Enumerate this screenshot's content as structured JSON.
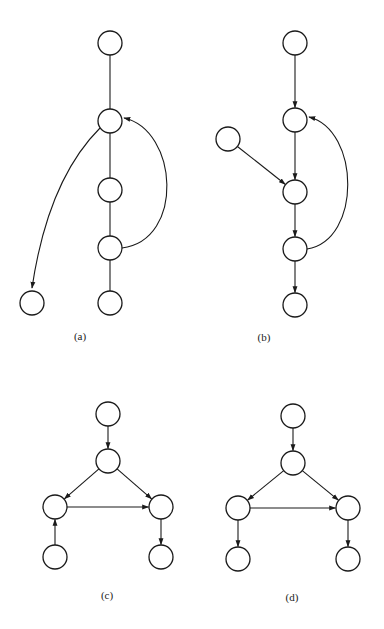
{
  "figure": {
    "panels": [
      {
        "id": "a",
        "caption": "(a)",
        "caption_pos": [
          80,
          330
        ],
        "nodes": [
          {
            "id": "a1",
            "x": 110,
            "y": 43
          },
          {
            "id": "a2",
            "x": 110,
            "y": 121
          },
          {
            "id": "a3",
            "x": 110,
            "y": 190
          },
          {
            "id": "a4",
            "x": 110,
            "y": 248
          },
          {
            "id": "a5",
            "x": 110,
            "y": 303
          },
          {
            "id": "a6",
            "x": 32,
            "y": 303
          }
        ],
        "edges": [
          {
            "from": "a1",
            "to": "a2",
            "directed": false,
            "type": "line"
          },
          {
            "from": "a2",
            "to": "a3",
            "directed": false,
            "type": "line"
          },
          {
            "from": "a3",
            "to": "a4",
            "directed": false,
            "type": "line"
          },
          {
            "from": "a4",
            "to": "a5",
            "directed": false,
            "type": "line"
          },
          {
            "from": "a2",
            "to": "a6",
            "directed": true,
            "type": "curve",
            "path": "M 100 128 Q 48 180 32 288"
          },
          {
            "from": "a4",
            "to": "a2",
            "directed": true,
            "type": "curve",
            "path": "M 122 248 C 185 240 178 130 124 118"
          }
        ]
      },
      {
        "id": "b",
        "caption": "(b)",
        "caption_pos": [
          264,
          331
        ],
        "nodes": [
          {
            "id": "b1",
            "x": 295,
            "y": 43
          },
          {
            "id": "b2",
            "x": 295,
            "y": 120
          },
          {
            "id": "b3",
            "x": 228,
            "y": 139
          },
          {
            "id": "b4",
            "x": 295,
            "y": 192
          },
          {
            "id": "b5",
            "x": 295,
            "y": 249
          },
          {
            "id": "b6",
            "x": 295,
            "y": 305
          }
        ],
        "edges": [
          {
            "from": "b1",
            "to": "b2",
            "directed": true,
            "type": "line"
          },
          {
            "from": "b2",
            "to": "b4",
            "directed": true,
            "type": "line"
          },
          {
            "from": "b3",
            "to": "b4",
            "directed": true,
            "type": "line"
          },
          {
            "from": "b4",
            "to": "b5",
            "directed": true,
            "type": "line"
          },
          {
            "from": "b5",
            "to": "b6",
            "directed": true,
            "type": "line"
          },
          {
            "from": "b5",
            "to": "b2",
            "directed": true,
            "type": "curve",
            "path": "M 307 249 C 362 240 360 130 309 117"
          }
        ]
      },
      {
        "id": "c",
        "caption": "(c)",
        "caption_pos": [
          107,
          589
        ],
        "nodes": [
          {
            "id": "c1",
            "x": 108,
            "y": 414
          },
          {
            "id": "c2",
            "x": 108,
            "y": 461
          },
          {
            "id": "c3",
            "x": 55,
            "y": 507
          },
          {
            "id": "c4",
            "x": 161,
            "y": 507
          },
          {
            "id": "c5",
            "x": 55,
            "y": 557
          },
          {
            "id": "c6",
            "x": 161,
            "y": 557
          }
        ],
        "edges": [
          {
            "from": "c1",
            "to": "c2",
            "directed": true,
            "type": "line"
          },
          {
            "from": "c2",
            "to": "c3",
            "directed": true,
            "type": "line"
          },
          {
            "from": "c2",
            "to": "c4",
            "directed": true,
            "type": "line"
          },
          {
            "from": "c3",
            "to": "c4",
            "directed": true,
            "type": "line"
          },
          {
            "from": "c5",
            "to": "c3",
            "directed": true,
            "type": "line"
          },
          {
            "from": "c4",
            "to": "c6",
            "directed": true,
            "type": "line"
          }
        ]
      },
      {
        "id": "d",
        "caption": "(d)",
        "caption_pos": [
          292,
          591
        ],
        "nodes": [
          {
            "id": "d1",
            "x": 293,
            "y": 416
          },
          {
            "id": "d2",
            "x": 293,
            "y": 463
          },
          {
            "id": "d3",
            "x": 238,
            "y": 508
          },
          {
            "id": "d4",
            "x": 348,
            "y": 508
          },
          {
            "id": "d5",
            "x": 238,
            "y": 559
          },
          {
            "id": "d6",
            "x": 348,
            "y": 559
          }
        ],
        "edges": [
          {
            "from": "d1",
            "to": "d2",
            "directed": true,
            "type": "line"
          },
          {
            "from": "d2",
            "to": "d3",
            "directed": true,
            "type": "line"
          },
          {
            "from": "d2",
            "to": "d4",
            "directed": true,
            "type": "line"
          },
          {
            "from": "d3",
            "to": "d4",
            "directed": true,
            "type": "line"
          },
          {
            "from": "d3",
            "to": "d5",
            "directed": true,
            "type": "line"
          },
          {
            "from": "d4",
            "to": "d6",
            "directed": true,
            "type": "line"
          }
        ]
      }
    ],
    "node_radius": 12,
    "colors": {
      "stroke": "#1a1a1a",
      "fill": "#ffffff",
      "background": "#ffffff"
    }
  }
}
